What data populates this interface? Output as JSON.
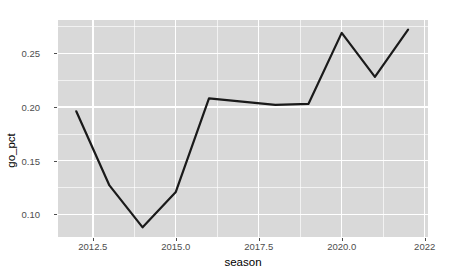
{
  "chart_data": {
    "type": "line",
    "title": "",
    "xlabel": "season",
    "ylabel": "go_pct",
    "x": [
      2012,
      2013,
      2014,
      2015,
      2016,
      2017,
      2018,
      2019,
      2020,
      2021,
      2022
    ],
    "values": [
      0.196,
      0.127,
      0.088,
      0.121,
      0.208,
      0.205,
      0.202,
      0.203,
      0.269,
      0.228,
      0.272
    ],
    "series": [
      {
        "name": "go_pct",
        "values": [
          0.196,
          0.127,
          0.088,
          0.121,
          0.208,
          0.205,
          0.202,
          0.203,
          0.269,
          0.228,
          0.272
        ]
      }
    ],
    "xlim": [
      2011.45,
      2022.6
    ],
    "ylim": [
      0.079,
      0.281
    ],
    "x_ticks": [
      2012.5,
      2015.0,
      2017.5,
      2020.0,
      2022.5
    ],
    "x_tick_labels": [
      "2012.5",
      "2015.0",
      "2017.5",
      "2020.0",
      "2022"
    ],
    "y_ticks": [
      0.1,
      0.15,
      0.2,
      0.25
    ],
    "y_tick_labels": [
      "0.10",
      "0.15",
      "0.20",
      "0.25"
    ],
    "grid": true,
    "legend": "none",
    "colors": {
      "panel_background": "#d9d9d9",
      "gridline": "#ffffff",
      "line": "#1a1a1a",
      "axis_text": "#4d4d4d",
      "axis_title": "#000000",
      "figure_background": "#ffffff"
    }
  },
  "axes": {
    "x_title": "season",
    "y_title": "go_pct"
  },
  "ticks": {
    "y": [
      "0.10",
      "0.15",
      "0.20",
      "0.25"
    ],
    "x": [
      "2012.5",
      "2015.0",
      "2017.5",
      "2020.0",
      "2022"
    ]
  }
}
